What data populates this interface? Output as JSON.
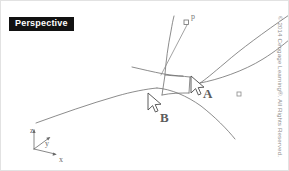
{
  "viewport": {
    "label": "Perspective"
  },
  "diagram": {
    "type": "3d-surface-pick-diagram",
    "line_color": "#6f6f6f",
    "stroke_width": 0.7,
    "picks": [
      {
        "id": "A",
        "label": "A",
        "cursor_x": 190,
        "cursor_y": 76,
        "label_x": 202,
        "label_y": 86
      },
      {
        "id": "B",
        "label": "B",
        "cursor_x": 147,
        "cursor_y": 96,
        "label_x": 159,
        "label_y": 110
      }
    ],
    "point_marker": {
      "label": "p",
      "x": 185,
      "y": 22,
      "label_x": 190,
      "label_y": 12
    },
    "secondary_marker": {
      "x": 238,
      "y": 93,
      "size": 4
    }
  },
  "axes": {
    "origin_x": 33,
    "origin_y": 148,
    "items": [
      {
        "name": "z",
        "label": "z",
        "tip_x": 33,
        "tip_y": 126
      },
      {
        "name": "y",
        "label": "y",
        "tip_x": 50,
        "tip_y": 136
      },
      {
        "name": "x",
        "label": "x",
        "tip_x": 56,
        "tip_y": 154
      }
    ]
  },
  "footer": {
    "copyright": "© 2014 Cengage Learning®. All Rights Reserved."
  }
}
